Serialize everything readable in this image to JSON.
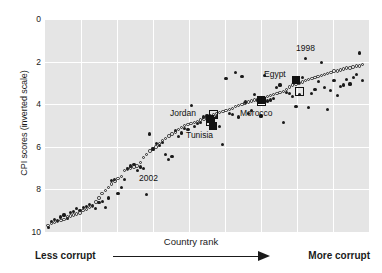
{
  "figure": {
    "title_remnant": "",
    "background": "#ffffff",
    "plot_background": "#e5e5e5",
    "gridline_color": "#ffffff",
    "marker_color": "#1a1a1a"
  },
  "axis": {
    "y_title": "CPI scores (inverted scale)",
    "x_title": "Country rank",
    "y_ticks": [
      "0",
      "2",
      "4",
      "6",
      "8",
      "10"
    ]
  },
  "scale_caption": {
    "left": "Less corrupt",
    "right": "More corrupt",
    "arrow": "arrow-right-icon"
  },
  "annotations": [
    {
      "label": "1998",
      "x": 296,
      "y": 44
    },
    {
      "label": "2002",
      "x": 139,
      "y": 174
    },
    {
      "label": "Jordan",
      "x": 170,
      "y": 109
    },
    {
      "label": "Tunisia",
      "x": 186,
      "y": 131
    },
    {
      "label": "Morocco",
      "x": 240,
      "y": 109
    },
    {
      "label": "Egypt",
      "x": 264,
      "y": 70
    }
  ],
  "chart_data": {
    "type": "scatter",
    "xlabel": "Country rank",
    "ylabel": "CPI scores (inverted scale)",
    "ylim": [
      0,
      10
    ],
    "y_inverted": true,
    "xlim": [
      0,
      102
    ],
    "grid": true,
    "legend": "none (series identified by in-plot text labels 1998 and 2002)",
    "series": [
      {
        "name": "1998",
        "marker": "filled-circle",
        "color": "#1a1a1a",
        "points": [
          [
            1,
            9.8
          ],
          [
            2,
            9.5
          ],
          [
            3,
            9.4
          ],
          [
            4,
            9.45
          ],
          [
            5,
            9.3
          ],
          [
            6,
            9.2
          ],
          [
            7,
            9.35
          ],
          [
            8,
            9.1
          ],
          [
            9,
            9.05
          ],
          [
            10,
            8.9
          ],
          [
            11,
            9.0
          ],
          [
            12,
            8.85
          ],
          [
            13,
            8.8
          ],
          [
            14,
            8.7
          ],
          [
            15,
            8.75
          ],
          [
            16,
            8.9
          ],
          [
            17,
            8.6
          ],
          [
            18,
            8.55
          ],
          [
            19,
            8.85
          ],
          [
            20,
            8.4
          ],
          [
            21,
            7.6
          ],
          [
            22,
            7.55
          ],
          [
            23,
            8.2
          ],
          [
            24,
            7.9
          ],
          [
            25,
            7.55
          ],
          [
            26,
            7.0
          ],
          [
            27,
            6.9
          ],
          [
            28,
            6.85
          ],
          [
            29,
            7.1
          ],
          [
            30,
            6.95
          ],
          [
            31,
            7.0
          ],
          [
            32,
            8.25
          ],
          [
            33,
            5.4
          ],
          [
            34,
            6.1
          ],
          [
            35,
            5.85
          ],
          [
            36,
            5.95
          ],
          [
            37,
            5.8
          ],
          [
            38,
            6.35
          ],
          [
            39,
            6.6
          ],
          [
            40,
            6.45
          ],
          [
            41,
            5.25
          ],
          [
            42,
            5.5
          ],
          [
            43,
            5.35
          ],
          [
            44,
            5.15
          ],
          [
            45,
            5.2
          ],
          [
            46,
            4.05
          ],
          [
            47,
            5.05
          ],
          [
            48,
            4.9
          ],
          [
            49,
            4.85
          ],
          [
            50,
            4.6
          ],
          [
            51,
            4.55
          ],
          [
            52,
            4.75
          ],
          [
            53,
            4.9
          ],
          [
            54,
            4.6
          ],
          [
            55,
            5.05
          ],
          [
            56,
            5.9
          ],
          [
            57,
            2.8
          ],
          [
            58,
            4.45
          ],
          [
            59,
            4.5
          ],
          [
            60,
            2.5
          ],
          [
            61,
            4.6
          ],
          [
            62,
            2.7
          ],
          [
            63,
            3.9
          ],
          [
            64,
            4.45
          ],
          [
            65,
            4.3
          ],
          [
            66,
            3.55
          ],
          [
            67,
            3.8
          ],
          [
            68,
            4.55
          ],
          [
            69,
            2.65
          ],
          [
            70,
            3.85
          ],
          [
            71,
            3.8
          ],
          [
            72,
            3.75
          ],
          [
            73,
            3.2
          ],
          [
            74,
            3.1
          ],
          [
            75,
            4.85
          ],
          [
            76,
            3.45
          ],
          [
            77,
            3.5
          ],
          [
            78,
            3.65
          ],
          [
            79,
            4.1
          ],
          [
            80,
            3.55
          ],
          [
            81,
            2.75
          ],
          [
            82,
            1.85
          ],
          [
            83,
            4.15
          ],
          [
            84,
            3.5
          ],
          [
            85,
            3.3
          ],
          [
            86,
            2.95
          ],
          [
            87,
            2.05
          ],
          [
            88,
            3.2
          ],
          [
            89,
            4.25
          ],
          [
            90,
            3.35
          ],
          [
            91,
            2.9
          ],
          [
            92,
            3.6
          ],
          [
            93,
            3.15
          ],
          [
            94,
            3.1
          ],
          [
            95,
            2.85
          ],
          [
            96,
            3.05
          ],
          [
            97,
            2.75
          ],
          [
            98,
            2.6
          ],
          [
            99,
            1.6
          ],
          [
            100,
            2.9
          ]
        ]
      },
      {
        "name": "2002",
        "marker": "open-circle",
        "color": "#2b2b2b",
        "points": [
          [
            1,
            9.7
          ],
          [
            2,
            9.6
          ],
          [
            3,
            9.55
          ],
          [
            4,
            9.5
          ],
          [
            5,
            9.45
          ],
          [
            6,
            9.4
          ],
          [
            7,
            9.3
          ],
          [
            8,
            9.25
          ],
          [
            9,
            9.2
          ],
          [
            10,
            9.15
          ],
          [
            11,
            9.1
          ],
          [
            12,
            9.0
          ],
          [
            13,
            8.95
          ],
          [
            14,
            8.85
          ],
          [
            15,
            8.8
          ],
          [
            16,
            8.6
          ],
          [
            17,
            8.4
          ],
          [
            18,
            8.2
          ],
          [
            19,
            8.05
          ],
          [
            20,
            7.9
          ],
          [
            21,
            7.75
          ],
          [
            22,
            7.6
          ],
          [
            23,
            7.5
          ],
          [
            24,
            7.4
          ],
          [
            25,
            7.1
          ],
          [
            26,
            7.05
          ],
          [
            27,
            7.0
          ],
          [
            28,
            6.95
          ],
          [
            29,
            6.9
          ],
          [
            30,
            6.75
          ],
          [
            31,
            6.5
          ],
          [
            32,
            6.35
          ],
          [
            33,
            6.2
          ],
          [
            34,
            6.1
          ],
          [
            35,
            6.0
          ],
          [
            36,
            5.85
          ],
          [
            37,
            5.7
          ],
          [
            38,
            5.6
          ],
          [
            39,
            5.5
          ],
          [
            40,
            5.4
          ],
          [
            41,
            5.3
          ],
          [
            42,
            5.2
          ],
          [
            43,
            5.1
          ],
          [
            44,
            5.0
          ],
          [
            45,
            4.95
          ],
          [
            46,
            4.9
          ],
          [
            47,
            4.85
          ],
          [
            48,
            4.8
          ],
          [
            49,
            4.75
          ],
          [
            50,
            4.7
          ],
          [
            51,
            4.6
          ],
          [
            52,
            4.55
          ],
          [
            53,
            4.5
          ],
          [
            54,
            4.45
          ],
          [
            55,
            4.4
          ],
          [
            56,
            4.35
          ],
          [
            57,
            4.3
          ],
          [
            58,
            4.25
          ],
          [
            59,
            4.2
          ],
          [
            60,
            4.1
          ],
          [
            61,
            4.05
          ],
          [
            62,
            4.0
          ],
          [
            63,
            3.95
          ],
          [
            64,
            3.9
          ],
          [
            65,
            3.85
          ],
          [
            66,
            3.8
          ],
          [
            67,
            3.8
          ],
          [
            68,
            3.75
          ],
          [
            69,
            3.7
          ],
          [
            70,
            3.65
          ],
          [
            71,
            3.6
          ],
          [
            72,
            3.55
          ],
          [
            73,
            3.5
          ],
          [
            74,
            3.45
          ],
          [
            75,
            3.4
          ],
          [
            76,
            3.3
          ],
          [
            77,
            3.2
          ],
          [
            78,
            3.1
          ],
          [
            79,
            3.05
          ],
          [
            80,
            3.0
          ],
          [
            81,
            2.95
          ],
          [
            82,
            2.9
          ],
          [
            83,
            2.85
          ],
          [
            84,
            2.8
          ],
          [
            85,
            2.75
          ],
          [
            86,
            2.7
          ],
          [
            87,
            2.65
          ],
          [
            88,
            2.6
          ],
          [
            89,
            2.55
          ],
          [
            90,
            2.5
          ],
          [
            91,
            2.45
          ],
          [
            92,
            2.45
          ],
          [
            93,
            2.4
          ],
          [
            94,
            2.35
          ],
          [
            95,
            2.3
          ],
          [
            96,
            2.3
          ],
          [
            97,
            2.25
          ],
          [
            98,
            2.2
          ],
          [
            99,
            2.2
          ],
          [
            100,
            2.15
          ]
        ]
      }
    ],
    "highlighted_countries": [
      {
        "name": "Jordan",
        "rank_1998": 52,
        "cpi_1998": 4.7,
        "rank_2002": 53,
        "cpi_2002": 4.5
      },
      {
        "name": "Tunisia",
        "rank_1998": 53,
        "cpi_1998": 5.0,
        "rank_2002": 52,
        "cpi_2002": 4.8
      },
      {
        "name": "Morocco",
        "rank_1998": 68,
        "cpi_1998": 3.8,
        "rank_2002": 68,
        "cpi_2002": 3.85
      },
      {
        "name": "Egypt",
        "rank_1998": 79,
        "cpi_1998": 2.85,
        "rank_2002": 80,
        "cpi_2002": 3.4
      }
    ]
  }
}
